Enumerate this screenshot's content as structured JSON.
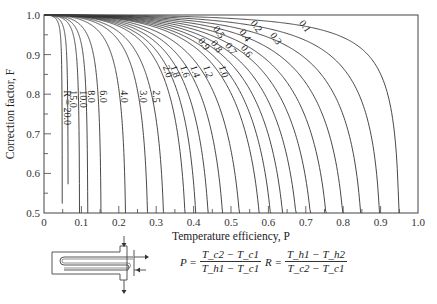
{
  "chart_data": {
    "type": "line",
    "title": "",
    "xlabel": "Temperature efficiency, P",
    "ylabel": "Correction factor, F",
    "xlim": [
      0,
      1.0
    ],
    "ylim": [
      0.5,
      1.0
    ],
    "x_ticks": [
      "0",
      "0.1",
      "0.2",
      "0.3",
      "0.4",
      "0.5",
      "0.6",
      "0.7",
      "0.8",
      "0.9",
      "1.0"
    ],
    "y_ticks": [
      "0.5",
      "0.6",
      "0.7",
      "0.8",
      "0.9",
      "1.0"
    ],
    "grid": false,
    "legend": "inline curve labels",
    "curve_parameter": "R",
    "series": [
      {
        "name": "R = 20.0",
        "R": 20.0,
        "label": "R = 20.0",
        "p_at_F05": 0.048
      },
      {
        "name": "15.0",
        "R": 15.0,
        "label": "15.0",
        "p_at_F05": 0.066
      },
      {
        "name": "10.0",
        "R": 10.0,
        "label": "10.0",
        "p_at_F05": 0.1
      },
      {
        "name": "8.0",
        "R": 8.0,
        "label": "8.0",
        "p_at_F05": 0.125
      },
      {
        "name": "6.0",
        "R": 6.0,
        "label": "6.0",
        "p_at_F05": 0.164
      },
      {
        "name": "4.0",
        "R": 4.0,
        "label": "4.0",
        "p_at_F05": 0.244
      },
      {
        "name": "3.0",
        "R": 3.0,
        "label": "3.0",
        "p_at_F05": 0.318
      },
      {
        "name": "2.5",
        "R": 2.5,
        "label": "2.5",
        "p_at_F05": 0.377
      },
      {
        "name": "2.0",
        "R": 2.0,
        "label": "2.0",
        "p_at_F05": 0.447
      },
      {
        "name": "1.8",
        "R": 1.8,
        "label": "1.8",
        "p_at_F05": 0.497
      },
      {
        "name": "1.6",
        "R": 1.6,
        "label": "1.6",
        "p_at_F05": 0.543
      },
      {
        "name": "1.4",
        "R": 1.4,
        "label": "1.4",
        "p_at_F05": 0.6
      },
      {
        "name": "1.2",
        "R": 1.2,
        "label": "1.2",
        "p_at_F05": 0.655
      },
      {
        "name": "1.0",
        "R": 1.0,
        "label": "1.0",
        "p_at_F05": 0.73
      },
      {
        "name": "0.9",
        "R": 0.9,
        "label": "0.9",
        "p_at_F05": 0.77
      },
      {
        "name": "0.8",
        "R": 0.8,
        "label": "0.8",
        "p_at_F05": 0.807
      },
      {
        "name": "0.7",
        "R": 0.7,
        "label": "0.7",
        "p_at_F05": 0.845
      },
      {
        "name": "0.6",
        "R": 0.6,
        "label": "0.6",
        "p_at_F05": 0.885
      },
      {
        "name": "0.5",
        "R": 0.5,
        "label": "0.5",
        "p_at_F05": 0.92
      },
      {
        "name": "0.4",
        "R": 0.4,
        "label": "0.4",
        "p_at_F05": 0.947
      },
      {
        "name": "0.3",
        "R": 0.3,
        "label": "0.3",
        "p_at_F05": 0.968
      },
      {
        "name": "0.2",
        "R": 0.2,
        "label": "0.2",
        "p_at_F05": 0.984
      },
      {
        "name": "0.1",
        "R": 0.1,
        "label": "0.1",
        "p_at_F05": 0.995
      }
    ],
    "annotations": {
      "formula_P": "P = (Tc2 − Tc1) / (Th1 − Tc1)",
      "formula_R": "R = (Th1 − Th2) / (Tc2 − Tc1)",
      "schematic": "1 shell pass, 2 tube passes heat exchanger"
    }
  },
  "formulas": {
    "P_lhs": "P =",
    "P_num": "T_c2 − T_c1",
    "P_den": "T_h1 − T_c1",
    "R_lhs": "R =",
    "R_num": "T_h1 − T_h2",
    "R_den": "T_c2 − T_c1"
  }
}
